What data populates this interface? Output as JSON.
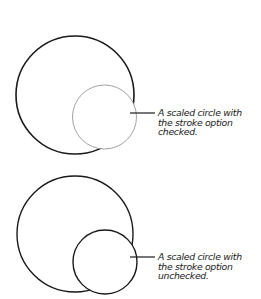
{
  "figures": [
    {
      "id": "stroke-checked",
      "caption_lines": [
        "A scaled circle with",
        "the stroke option",
        "checked."
      ],
      "large_circle": {
        "cx": 75,
        "cy": 95,
        "r": 59,
        "stroke": "#1a1a1a",
        "stroke_width": 1.6
      },
      "small_circle": {
        "cx": 104.5,
        "cy": 117,
        "r": 32,
        "stroke": "#8a8a8a",
        "stroke_width": 0.8
      },
      "leader": {
        "x1": 130,
        "y1": 113,
        "x2": 155,
        "y2": 113
      }
    },
    {
      "id": "stroke-unchecked",
      "caption_lines": [
        "A scaled circle with",
        "the stroke option",
        "unchecked."
      ],
      "large_circle": {
        "cx": 75,
        "cy": 234,
        "r": 58,
        "stroke": "#1a1a1a",
        "stroke_width": 1.4
      },
      "small_circle": {
        "cx": 105,
        "cy": 262,
        "r": 32,
        "stroke": "#1a1a1a",
        "stroke_width": 1.4
      },
      "leader": {
        "x1": 130,
        "y1": 257,
        "x2": 155,
        "y2": 257
      }
    }
  ]
}
